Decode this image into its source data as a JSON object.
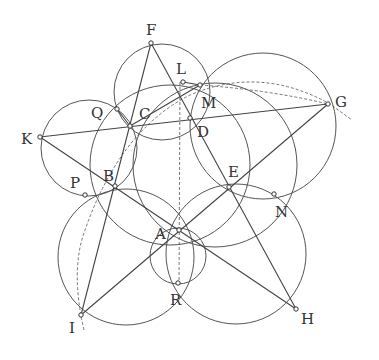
{
  "diagram": {
    "type": "geometry-construction",
    "stroke_color": "#555555",
    "label_color": "#333333",
    "points": [
      {
        "name": "F",
        "x": 151,
        "y": 43,
        "lx": 146,
        "ly": 35
      },
      {
        "name": "L",
        "x": 183,
        "y": 82,
        "lx": 176,
        "ly": 74
      },
      {
        "name": "M",
        "x": 200,
        "y": 85,
        "lx": 201,
        "ly": 108
      },
      {
        "name": "Q",
        "x": 117,
        "y": 109,
        "lx": 91,
        "ly": 118
      },
      {
        "name": "C",
        "x": 130,
        "y": 126,
        "lx": 139,
        "ly": 119
      },
      {
        "name": "D",
        "x": 190,
        "y": 118,
        "lx": 197,
        "ly": 137
      },
      {
        "name": "G",
        "x": 328,
        "y": 104,
        "lx": 335,
        "ly": 107
      },
      {
        "name": "K",
        "x": 40,
        "y": 137,
        "lx": 21,
        "ly": 144
      },
      {
        "name": "B",
        "x": 115,
        "y": 186,
        "lx": 103,
        "ly": 181
      },
      {
        "name": "P",
        "x": 85,
        "y": 195,
        "lx": 70,
        "ly": 188
      },
      {
        "name": "E",
        "x": 229,
        "y": 187,
        "lx": 228,
        "ly": 177
      },
      {
        "name": "N",
        "x": 274,
        "y": 194,
        "lx": 275,
        "ly": 217
      },
      {
        "name": "A",
        "x": 179,
        "y": 230,
        "lx": 155,
        "ly": 239
      },
      {
        "name": "R",
        "x": 178,
        "y": 283,
        "lx": 170,
        "ly": 305
      },
      {
        "name": "I",
        "x": 81,
        "y": 315,
        "lx": 69,
        "ly": 333
      },
      {
        "name": "H",
        "x": 296,
        "y": 309,
        "lx": 301,
        "ly": 324
      }
    ],
    "segments": [
      [
        "F",
        "I"
      ],
      [
        "F",
        "H"
      ],
      [
        "K",
        "G"
      ],
      [
        "K",
        "H"
      ],
      [
        "I",
        "G"
      ],
      [
        "Q",
        "C"
      ],
      [
        "C",
        "M"
      ],
      [
        "L",
        "M"
      ]
    ],
    "circles": [
      {
        "cx": 162,
        "cy": 92,
        "r": 48
      },
      {
        "cx": 89,
        "cy": 148,
        "r": 48
      },
      {
        "cx": 126,
        "cy": 257,
        "r": 68
      },
      {
        "cx": 263,
        "cy": 126,
        "r": 73
      },
      {
        "cx": 236,
        "cy": 254,
        "r": 70
      },
      {
        "cx": 170,
        "cy": 165,
        "r": 80
      },
      {
        "cx": 215,
        "cy": 165,
        "r": 82
      },
      {
        "cx": 178,
        "cy": 256,
        "r": 28
      }
    ],
    "dashed_paths": [
      "M 84 330 Q 70 270 85 230 Q 120 130 190 95 Q 260 65 330 104 L 352 120",
      "M 200 85 Q 270 90 328 104",
      "M 180 82 L 179 285"
    ]
  }
}
